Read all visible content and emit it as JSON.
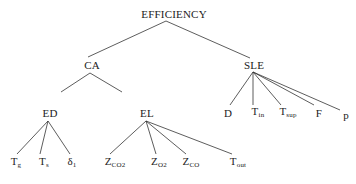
{
  "diagram": {
    "type": "tree",
    "title": "EFFICIENCY",
    "line_color": "#333333",
    "nodes": {
      "root": {
        "label": "EFFICIENCY",
        "sub": ""
      },
      "ca": {
        "label": "CA",
        "sub": ""
      },
      "sle": {
        "label": "SLE",
        "sub": ""
      },
      "ed": {
        "label": "ED",
        "sub": ""
      },
      "el": {
        "label": "EL",
        "sub": ""
      },
      "tg": {
        "label": "T",
        "sub": "g"
      },
      "ts": {
        "label": "T",
        "sub": "s"
      },
      "d1": {
        "label": "δ",
        "sub": "1"
      },
      "zco2": {
        "label": "Z",
        "sub": "CO2"
      },
      "zo2": {
        "label": "Z",
        "sub": "O2"
      },
      "zco": {
        "label": "Z",
        "sub": "CO"
      },
      "tout": {
        "label": "T",
        "sub": "out"
      },
      "d": {
        "label": "D",
        "sub": ""
      },
      "tin": {
        "label": "T",
        "sub": "in"
      },
      "tsup": {
        "label": "T",
        "sub": "sup"
      },
      "f": {
        "label": "F",
        "sub": ""
      },
      "p": {
        "label": "p",
        "sub": ""
      }
    },
    "edges": [
      [
        "EFFICIENCY",
        "CA"
      ],
      [
        "EFFICIENCY",
        "SLE"
      ],
      [
        "CA",
        "ED"
      ],
      [
        "CA",
        "EL"
      ],
      [
        "ED",
        "Tg"
      ],
      [
        "ED",
        "Ts"
      ],
      [
        "ED",
        "δ1"
      ],
      [
        "EL",
        "ZCO2"
      ],
      [
        "EL",
        "ZO2"
      ],
      [
        "EL",
        "ZCO"
      ],
      [
        "EL",
        "Tout"
      ],
      [
        "SLE",
        "D"
      ],
      [
        "SLE",
        "Tin"
      ],
      [
        "SLE",
        "Tsup"
      ],
      [
        "SLE",
        "F"
      ],
      [
        "SLE",
        "p"
      ]
    ]
  }
}
